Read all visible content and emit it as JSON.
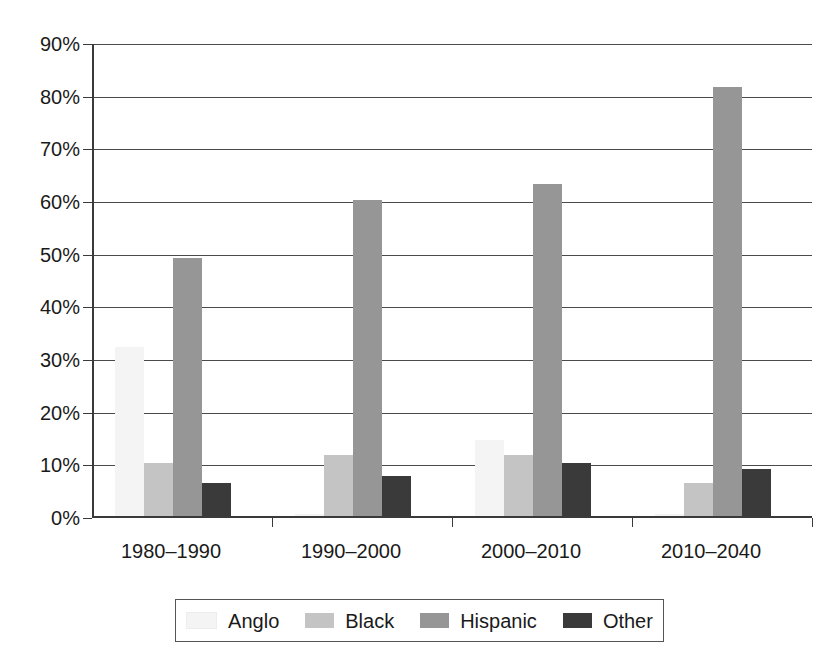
{
  "chart_data": {
    "type": "bar",
    "title": "",
    "subtitle": "",
    "xlabel": "",
    "ylabel": "",
    "categories": [
      "1980–1990",
      "1990–2000",
      "2000–2010",
      "2010–2040"
    ],
    "series": [
      {
        "name": "Anglo",
        "color": "#f4f4f4",
        "values": [
          32,
          0.4,
          14.5,
          0.4
        ]
      },
      {
        "name": "Black",
        "color": "#c4c4c4",
        "values": [
          10,
          11.5,
          11.5,
          6.3
        ]
      },
      {
        "name": "Hispanic",
        "color": "#969696",
        "values": [
          49,
          60,
          63,
          81.5
        ]
      },
      {
        "name": "Other",
        "color": "#3a3a3a",
        "values": [
          6.2,
          7.6,
          10,
          9
        ]
      }
    ],
    "ylim": [
      0,
      90
    ],
    "ytick_values": [
      0,
      10,
      20,
      30,
      40,
      50,
      60,
      70,
      80,
      90
    ],
    "ytick_labels": [
      "0%",
      "10%",
      "20%",
      "30%",
      "40%",
      "50%",
      "60%",
      "70%",
      "80%",
      "90%"
    ],
    "grid": "horizontal",
    "legend_position": "bottom",
    "legend_entries": [
      "Anglo",
      "Black",
      "Hispanic",
      "Other"
    ],
    "axis_color": "#3a3a3a",
    "background_color": "#ffffff"
  }
}
